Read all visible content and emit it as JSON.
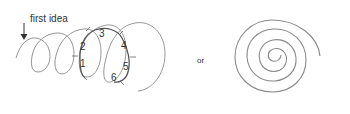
{
  "diagram": {
    "left": {
      "annotation": "first idea",
      "numbers": [
        "1",
        "2",
        "3",
        "4",
        "5",
        "6"
      ],
      "description": "looping coil line with a highlighted loop marked with numbered tick positions 1-6"
    },
    "connector": "or",
    "right": {
      "description": "concentric inward spiral"
    },
    "colors": {
      "stroke": "#8a8a8a",
      "highlight_stroke": "#555555",
      "text": "#333333"
    }
  }
}
